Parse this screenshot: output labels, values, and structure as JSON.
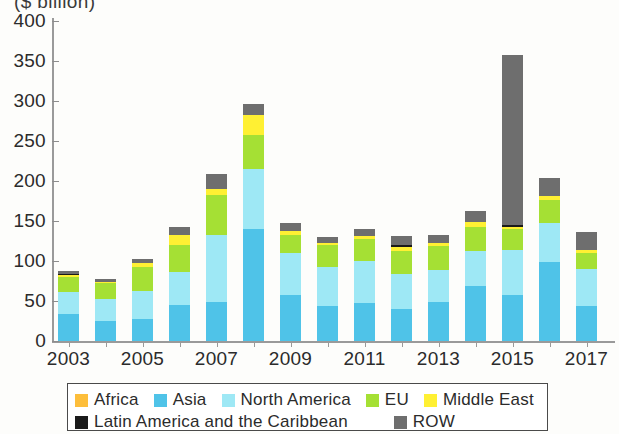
{
  "chart_data": {
    "type": "bar",
    "stacked": true,
    "title": "($ billion)",
    "xlabel": "",
    "ylabel": "($ billion)",
    "ylim": [
      0,
      400
    ],
    "yticks": [
      0,
      50,
      100,
      150,
      200,
      250,
      300,
      350,
      400
    ],
    "xtick_labels": [
      "2003",
      "2005",
      "2007",
      "2009",
      "2011",
      "2013",
      "2015",
      "2017"
    ],
    "grid": false,
    "legend_position": "bottom",
    "categories": [
      "2003",
      "2004",
      "2005",
      "2006",
      "2007",
      "2008",
      "2009",
      "2010",
      "2011",
      "2012",
      "2013",
      "2014",
      "2015",
      "2016",
      "2017"
    ],
    "series": [
      {
        "name": "Africa",
        "color": "#FDBE3B",
        "values": [
          0,
          0,
          0,
          0,
          0,
          0,
          0,
          0,
          0,
          0,
          0,
          0,
          0,
          0,
          0
        ]
      },
      {
        "name": "Asia",
        "color": "#4FC3E8",
        "values": [
          34,
          25,
          28,
          45,
          49,
          140,
          57,
          44,
          47,
          40,
          49,
          69,
          58,
          99,
          44
        ]
      },
      {
        "name": "North America",
        "color": "#9EE8F5",
        "values": [
          27,
          28,
          35,
          41,
          83,
          75,
          53,
          48,
          53,
          44,
          40,
          43,
          56,
          48,
          46
        ]
      },
      {
        "name": "EU",
        "color": "#A5E034",
        "values": [
          19,
          20,
          30,
          34,
          50,
          43,
          23,
          28,
          27,
          29,
          30,
          31,
          26,
          29,
          20
        ]
      },
      {
        "name": "Middle East",
        "color": "#FFF033",
        "values": [
          2,
          1,
          4,
          12,
          8,
          25,
          5,
          3,
          4,
          5,
          4,
          6,
          3,
          5,
          4
        ]
      },
      {
        "name": "Latin America and the Caribbean",
        "color": "#1A1A1A",
        "values": [
          2,
          0,
          0,
          0,
          0,
          0,
          0,
          0,
          0,
          2,
          0,
          0,
          2,
          0,
          0
        ]
      },
      {
        "name": "ROW",
        "color": "#6E6E6E",
        "values": [
          3,
          3,
          5,
          11,
          19,
          13,
          9,
          7,
          9,
          11,
          10,
          14,
          212,
          23,
          22
        ]
      }
    ],
    "totals": [
      87,
      77,
      102,
      143,
      209,
      296,
      147,
      130,
      140,
      131,
      133,
      163,
      357,
      204,
      136
    ]
  },
  "legend": {
    "row1": [
      {
        "label": "Africa",
        "color": "#FDBE3B",
        "icon": "color-swatch"
      },
      {
        "label": "Asia",
        "color": "#4FC3E8",
        "icon": "color-swatch"
      },
      {
        "label": "North America",
        "color": "#9EE8F5",
        "icon": "color-swatch"
      },
      {
        "label": "EU",
        "color": "#A5E034",
        "icon": "color-swatch"
      },
      {
        "label": "Middle East",
        "color": "#FFF033",
        "icon": "color-swatch"
      }
    ],
    "row2": [
      {
        "label": "Latin America and the Caribbean",
        "color": "#1A1A1A",
        "icon": "color-swatch"
      },
      {
        "label": "ROW",
        "color": "#6E6E6E",
        "icon": "color-swatch"
      }
    ]
  }
}
